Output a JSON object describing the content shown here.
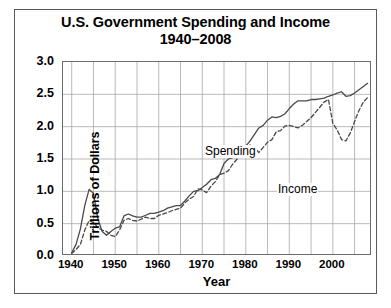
{
  "figure": {
    "title_line1": "U.S. Government Spending and Income",
    "title_line2": "1940–2008",
    "background_color": "#ffffff",
    "border_color": "#5a5a5a"
  },
  "chart_data": {
    "type": "line",
    "title": "U.S. Government Spending and Income 1940–2008",
    "subtitle": "1940–2008",
    "xlabel": "Year",
    "ylabel": "Trillions of Dollars",
    "xlim": [
      1938,
      2009
    ],
    "ylim": [
      0.0,
      3.0
    ],
    "xticks": [
      1940,
      1950,
      1960,
      1970,
      1980,
      1990,
      2000
    ],
    "xtick_labels": [
      "1940",
      "1950",
      "1960",
      "1970",
      "1980",
      "1990",
      "2000"
    ],
    "yticks": [
      0.0,
      0.5,
      1.0,
      1.5,
      2.0,
      2.5,
      3.0
    ],
    "ytick_labels": [
      "0.0",
      "0.5",
      "1.0",
      "1.5",
      "2.0",
      "2.5",
      "3.0"
    ],
    "grid": true,
    "grid_x_step": 5,
    "grid_y_step": 0.5,
    "grid_color": "#a8a8a8",
    "legend": "inline-annotations",
    "annotations": [
      {
        "text": "Spending",
        "series": "Spending",
        "x": 1977,
        "y": 1.62
      },
      {
        "text": "Income",
        "series": "Income",
        "x": 1991,
        "y": 1.05
      }
    ],
    "series": [
      {
        "name": "Spending",
        "style": "solid",
        "color": "#4a4a4a",
        "x": [
          1940,
          1941,
          1942,
          1943,
          1944,
          1945,
          1946,
          1947,
          1948,
          1949,
          1950,
          1951,
          1952,
          1953,
          1954,
          1955,
          1956,
          1957,
          1958,
          1959,
          1960,
          1961,
          1962,
          1963,
          1964,
          1965,
          1966,
          1967,
          1968,
          1969,
          1970,
          1971,
          1972,
          1973,
          1974,
          1975,
          1976,
          1977,
          1978,
          1979,
          1980,
          1981,
          1982,
          1983,
          1984,
          1985,
          1986,
          1987,
          1988,
          1989,
          1990,
          1991,
          1992,
          1993,
          1994,
          1995,
          1996,
          1997,
          1998,
          1999,
          2000,
          2001,
          2002,
          2003,
          2004,
          2005,
          2006,
          2007,
          2008
        ],
        "values": [
          0.05,
          0.18,
          0.42,
          0.78,
          1.03,
          0.97,
          0.58,
          0.38,
          0.32,
          0.38,
          0.43,
          0.45,
          0.62,
          0.65,
          0.62,
          0.6,
          0.6,
          0.63,
          0.66,
          0.66,
          0.68,
          0.7,
          0.74,
          0.76,
          0.78,
          0.78,
          0.85,
          0.93,
          1.0,
          1.01,
          1.06,
          1.11,
          1.18,
          1.2,
          1.26,
          1.43,
          1.5,
          1.52,
          1.55,
          1.58,
          1.7,
          1.78,
          1.88,
          1.98,
          2.02,
          2.1,
          2.15,
          2.14,
          2.16,
          2.2,
          2.28,
          2.35,
          2.4,
          2.4,
          2.4,
          2.42,
          2.42,
          2.43,
          2.44,
          2.47,
          2.49,
          2.52,
          2.54,
          2.47,
          2.48,
          2.52,
          2.57,
          2.62,
          2.67
        ]
      },
      {
        "name": "Income",
        "style": "dashed",
        "color": "#4a4a4a",
        "x": [
          1940,
          1941,
          1942,
          1943,
          1944,
          1945,
          1946,
          1947,
          1948,
          1949,
          1950,
          1951,
          1952,
          1953,
          1954,
          1955,
          1956,
          1957,
          1958,
          1959,
          1960,
          1961,
          1962,
          1963,
          1964,
          1965,
          1966,
          1967,
          1968,
          1969,
          1970,
          1971,
          1972,
          1973,
          1974,
          1975,
          1976,
          1977,
          1978,
          1979,
          1980,
          1981,
          1982,
          1983,
          1984,
          1985,
          1986,
          1987,
          1988,
          1989,
          1990,
          1991,
          1992,
          1993,
          1994,
          1995,
          1996,
          1997,
          1998,
          1999,
          2000,
          2001,
          2002,
          2003,
          2004,
          2005,
          2006,
          2007,
          2008
        ],
        "values": [
          0.04,
          0.1,
          0.18,
          0.4,
          0.55,
          0.52,
          0.44,
          0.4,
          0.38,
          0.32,
          0.3,
          0.4,
          0.55,
          0.58,
          0.55,
          0.54,
          0.57,
          0.6,
          0.58,
          0.58,
          0.63,
          0.65,
          0.67,
          0.7,
          0.72,
          0.74,
          0.82,
          0.88,
          0.92,
          1.04,
          1.02,
          0.98,
          1.08,
          1.15,
          1.26,
          1.28,
          1.32,
          1.42,
          1.5,
          1.58,
          1.62,
          1.72,
          1.68,
          1.6,
          1.68,
          1.76,
          1.8,
          1.92,
          1.94,
          2.01,
          2.02,
          2.0,
          1.98,
          2.02,
          2.08,
          2.14,
          2.22,
          2.3,
          2.38,
          2.42,
          2.05,
          1.95,
          1.8,
          1.78,
          1.9,
          2.08,
          2.25,
          2.38,
          2.45
        ]
      }
    ]
  }
}
